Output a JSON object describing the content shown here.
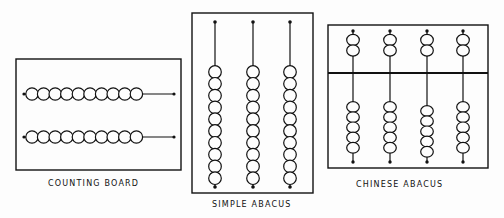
{
  "diagrams": [
    {
      "id": "counting-board",
      "label": "COUNTING BOARD",
      "rows": 2,
      "beads_per_row": 10
    },
    {
      "id": "simple-abacus",
      "label": "SIMPLE ABACUS",
      "rods": 3,
      "beads_per_rod": 10
    },
    {
      "id": "chinese-abacus",
      "label": "CHINESE ABACUS",
      "rods": 4,
      "upper_beads_per_rod": 2,
      "lower_beads_per_rod": 5
    }
  ],
  "colors": {
    "ink": "#111111",
    "paper": "#fdfdfd"
  }
}
